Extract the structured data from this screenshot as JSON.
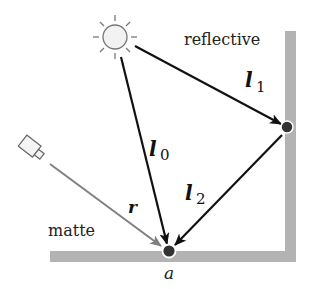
{
  "diagram": {
    "labels": {
      "reflective": "reflective",
      "matte": "matte",
      "point_a": "a",
      "ray_r": "r",
      "l0_base": "l",
      "l0_sub": "0",
      "l1_base": "l",
      "l1_sub": "1",
      "l2_base": "l",
      "l2_sub": "2"
    },
    "icons": {
      "light_source": "sun-icon",
      "camera": "camera-icon"
    },
    "colors": {
      "surface": "#b3b3b3",
      "ray": "#111111",
      "view_ray": "#808080",
      "point": "#333333",
      "sun_stroke": "#777777",
      "sun_fill": "#f2f2f2"
    }
  }
}
